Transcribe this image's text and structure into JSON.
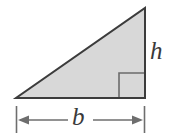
{
  "figure": {
    "kind": "geometry-diagram",
    "width": 174,
    "height": 139,
    "background_color": "#ffffff"
  },
  "triangle": {
    "name": "right-triangle",
    "fill_color": "#d8d8d8",
    "stroke_color": "#3c3c3c",
    "stroke_width": 2,
    "vertices": {
      "apex": {
        "x": 145,
        "y": 8
      },
      "bottom_left": {
        "x": 16,
        "y": 98
      },
      "bottom_right": {
        "x": 145,
        "y": 98
      }
    }
  },
  "right_angle_marker": {
    "name": "right-angle-marker",
    "stroke_color": "#6b6b6b",
    "stroke_width": 1.6,
    "x": 119,
    "y": 73,
    "size": 25
  },
  "labels": {
    "height": {
      "text": "h",
      "meaning": "height of triangle"
    },
    "base": {
      "text": "b",
      "meaning": "base of triangle"
    }
  },
  "dimension_line": {
    "name": "base-dimension-line",
    "stroke_color": "#6e6e6e",
    "stroke_width": 1.5,
    "y": 120,
    "x_start": 16,
    "x_end": 145,
    "tick_top": 106,
    "tick_bottom": 133,
    "arrow_length": 11,
    "arrow_half_height": 4.5
  },
  "colors": {
    "fill": "#d8d8d8",
    "outline": "#3c3c3c",
    "dimension": "#6e6e6e",
    "label": "#3a3a3a",
    "background": "#ffffff"
  }
}
